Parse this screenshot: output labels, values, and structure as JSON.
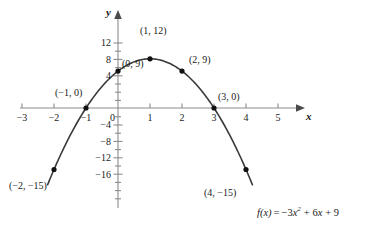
{
  "chart_data": {
    "type": "line",
    "title": "",
    "xlabel": "x",
    "ylabel": "y",
    "function": "f(x) = -3x^2 + 6x + 9",
    "xlim": [
      -3.4,
      5.6
    ],
    "ylim": [
      -18.5,
      13.5
    ],
    "grid": false,
    "legend": "none",
    "x_ticks": [
      -3,
      -2,
      -1,
      0,
      1,
      2,
      3,
      4,
      5
    ],
    "x_tick_labels": [
      "−3",
      "−2",
      "−1",
      "0",
      "1",
      "2",
      "3",
      "4",
      "5"
    ],
    "y_ticks": [
      -16,
      -12,
      -8,
      -4,
      0,
      4,
      8,
      12
    ],
    "y_tick_labels": [
      "−16",
      "−12",
      "−8",
      "−4",
      "0",
      "4",
      "8",
      "12"
    ],
    "y_minor_ticks": [
      -18,
      -14,
      -10,
      -6,
      -2,
      2,
      6,
      10
    ],
    "series": [
      {
        "name": "f(x) = -3x^2 + 6x + 9",
        "x": [
          -2.2,
          -2,
          -1.5,
          -1,
          -0.5,
          0,
          0.5,
          1,
          1.5,
          2,
          2.5,
          3,
          3.5,
          4,
          4.2
        ],
        "y": [
          -18.1,
          -15,
          -6.75,
          0,
          5.25,
          9,
          11.25,
          12,
          11.25,
          9,
          5.25,
          0,
          -6.75,
          -15,
          -18.1
        ]
      }
    ],
    "points": [
      {
        "name": "vertex",
        "x": 1,
        "y": 12,
        "label": "(1, 12)"
      },
      {
        "name": "y-intercept",
        "x": 0,
        "y": 9,
        "label": "(0, 9)"
      },
      {
        "name": "point-2-9",
        "x": 2,
        "y": 9,
        "label": "(2, 9)"
      },
      {
        "name": "x-intercept-left",
        "x": -1,
        "y": 0,
        "label": "(−1, 0)"
      },
      {
        "name": "x-intercept-right",
        "x": 3,
        "y": 0,
        "label": "(3, 0)"
      },
      {
        "name": "point-neg2",
        "x": -2,
        "y": -15,
        "label": "(−2, −15)"
      },
      {
        "name": "point-4",
        "x": 4,
        "y": -15,
        "label": "(4, −15)"
      }
    ]
  },
  "axes": {
    "x_axis_label": "x",
    "y_axis_label": "y"
  },
  "tick_labels": {
    "x": {
      "m3": "−3",
      "m2": "−2",
      "m1": "−1",
      "zero": "0",
      "p1": "1",
      "p2": "2",
      "p3": "3",
      "p4": "4",
      "p5": "5"
    },
    "y": {
      "p12": "12",
      "p8": "8",
      "p4": "4",
      "m4": "−4",
      "m8": "−8",
      "m12": "−12",
      "m16": "−16"
    }
  },
  "point_labels": {
    "vertex": "(1, 12)",
    "y_intercept": "(0, 9)",
    "right_nine": "(2, 9)",
    "left_root": "(−1, 0)",
    "right_root": "(3, 0)",
    "left_low": "(−2, −15)",
    "right_low": "(4, −15)"
  },
  "equation": {
    "fx": "f(x)",
    "equals": "=",
    "term1_sign": "−",
    "term1_coeff": "3",
    "term1_var": "x",
    "term1_exp": "2",
    "term2": "+ 6",
    "term2_var": "x",
    "term3": "+ 9",
    "full": "f(x) = −3x² + 6x + 9"
  },
  "colors": {
    "curve": "#3a3a3a",
    "axis": "#8c8c8c",
    "point": "#111111",
    "text": "#1a1a1a",
    "background": "#ffffff"
  }
}
